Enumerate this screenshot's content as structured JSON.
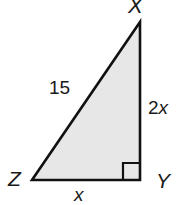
{
  "figure": {
    "type": "right-triangle-diagram",
    "fill_color": "#e7e7e7",
    "stroke_color": "#111111",
    "background_color": "#ffffff",
    "vertices": {
      "apex": {
        "label": "X",
        "x": 140,
        "y": 22
      },
      "right_angle": {
        "label": "Y",
        "x": 140,
        "y": 180
      },
      "left": {
        "label": "Z",
        "x": 32,
        "y": 180
      }
    },
    "sides": {
      "hypotenuse": {
        "label": "15",
        "from": "Z",
        "to": "X"
      },
      "vertical_leg": {
        "label": "2x",
        "prefix": "2",
        "variable": "x",
        "from": "X",
        "to": "Y"
      },
      "base_leg": {
        "label": "x",
        "variable": "x",
        "from": "Z",
        "to": "Y"
      }
    },
    "right_angle_marker": {
      "at_vertex": "Y",
      "size": 17
    }
  }
}
